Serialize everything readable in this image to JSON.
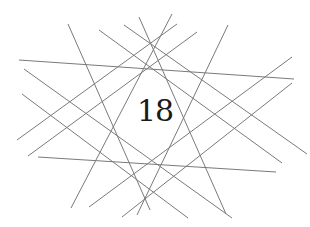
{
  "figure": {
    "number": "18",
    "line_color": "#7a7a7a",
    "lines": [
      {
        "x1": 19,
        "y1": 60,
        "x2": 294,
        "y2": 79
      },
      {
        "x1": 38,
        "y1": 157,
        "x2": 276,
        "y2": 172
      },
      {
        "x1": 68,
        "y1": 24,
        "x2": 150,
        "y2": 210
      },
      {
        "x1": 228,
        "y1": 25,
        "x2": 137,
        "y2": 215
      },
      {
        "x1": 139,
        "y1": 17,
        "x2": 226,
        "y2": 214
      },
      {
        "x1": 172,
        "y1": 14,
        "x2": 71,
        "y2": 208
      },
      {
        "x1": 24,
        "y1": 69,
        "x2": 232,
        "y2": 218
      },
      {
        "x1": 22,
        "y1": 94,
        "x2": 188,
        "y2": 218
      },
      {
        "x1": 99,
        "y1": 30,
        "x2": 282,
        "y2": 163
      },
      {
        "x1": 124,
        "y1": 25,
        "x2": 307,
        "y2": 154
      },
      {
        "x1": 17,
        "y1": 140,
        "x2": 177,
        "y2": 24
      },
      {
        "x1": 28,
        "y1": 156,
        "x2": 197,
        "y2": 32
      },
      {
        "x1": 89,
        "y1": 207,
        "x2": 292,
        "y2": 57
      },
      {
        "x1": 122,
        "y1": 217,
        "x2": 292,
        "y2": 83
      }
    ]
  }
}
